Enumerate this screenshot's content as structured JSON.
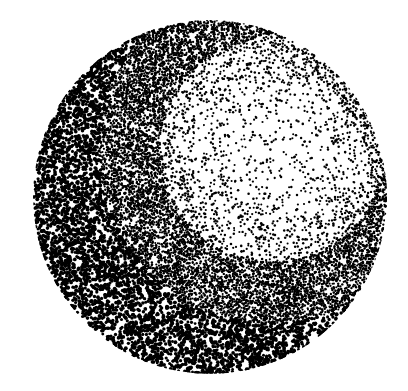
{
  "image": {
    "description": "Stippled (pointillist) black-on-white illustration of a sphere lit from the upper right",
    "width": 408,
    "height": 391,
    "background": "#ffffff",
    "ink": "#000000"
  },
  "sphere": {
    "cx": 210,
    "cy": 197,
    "r": 177,
    "light_center": {
      "x": 272,
      "y": 150
    },
    "terminator_radius": 150,
    "band_width": 38,
    "dot_count": 26000,
    "seed": 7
  }
}
